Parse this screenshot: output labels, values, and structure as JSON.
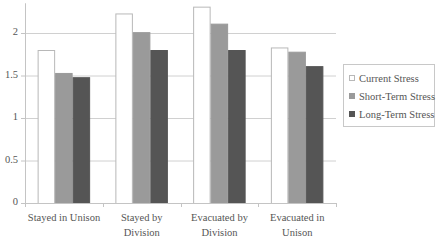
{
  "chart_data": {
    "type": "bar",
    "title": "",
    "xlabel": "",
    "ylabel": "",
    "categories": [
      "Stayed in Unison",
      "Stayed by Division",
      "Evacuated by Division",
      "Evacuated in Unison"
    ],
    "category_lines": [
      [
        "Stayed in Unison"
      ],
      [
        "Stayed by",
        "Division"
      ],
      [
        "Evacuated by",
        "Division"
      ],
      [
        "Evacuated in",
        "Unison"
      ]
    ],
    "series": [
      {
        "name": "Current Stress",
        "color": "#ffffff",
        "stroke": "#b8b8b8",
        "values": [
          1.8,
          2.23,
          2.31,
          1.83
        ]
      },
      {
        "name": "Short-Term Stress",
        "color": "#9a9a9a",
        "stroke": "#9a9a9a",
        "values": [
          1.53,
          2.01,
          2.11,
          1.78
        ]
      },
      {
        "name": "Long-Term Stress",
        "color": "#555555",
        "stroke": "#555555",
        "values": [
          1.48,
          1.8,
          1.8,
          1.61
        ]
      }
    ],
    "ylim": [
      0,
      2.35
    ],
    "yticks": [
      0,
      0.5,
      1,
      1.5,
      2
    ],
    "ytick_labels": [
      "0",
      "0.5",
      "1",
      "1.5",
      "2"
    ],
    "grid": true,
    "legend_position": "right"
  }
}
